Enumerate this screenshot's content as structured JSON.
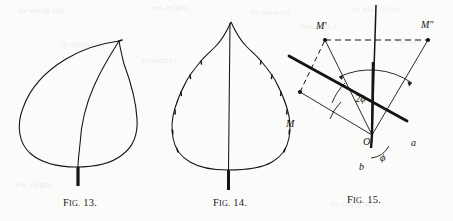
{
  "page": {
    "background_color": "#fbfbfa",
    "ink_color": "#141414",
    "width": 453,
    "height": 221
  },
  "figures": [
    {
      "id": "fig-13",
      "caption_lead": "F",
      "caption_lead_rest": "IG.",
      "caption_number": "13.",
      "caption_full": "FIG. 13.",
      "subject": "asymmetric-ovate-leaf-with-entire-margin",
      "description": "Leaf outline with acuminate apex at upper right, broad rounded base, single midrib and short petiole"
    },
    {
      "id": "fig-14",
      "caption_lead": "F",
      "caption_lead_rest": "IG.",
      "caption_number": "14.",
      "caption_full": "FIG. 14.",
      "subject": "symmetric-ovate-leaf-with-crenate-margin",
      "description": "Symmetrical leaf outline with scalloped margin, central midrib and short petiole"
    },
    {
      "id": "fig-15",
      "caption_lead": "F",
      "caption_lead_rest": "IG.",
      "caption_number": "15.",
      "caption_full": "FIG. 15.",
      "subject": "geometric-reflection-diagram",
      "description": "Two mirror lines through point O; point M reflected to M' and to M''; angle 2 phi subtended at O"
    }
  ],
  "fig15_labels": {
    "origin": "O",
    "point_m": "M",
    "point_m_prime": "M'",
    "point_m_double_prime": "M″",
    "axis_a": "a",
    "axis_b": "b",
    "angle_phi": "ϕ",
    "angle_two_phi": "2ϕ"
  },
  "bleed_text": {
    "line1": "the plane of",
    "line2": "angles are",
    "line3": "rotation of",
    "line4": "reflection in",
    "line5": "a line and",
    "line6": "symmetry"
  }
}
